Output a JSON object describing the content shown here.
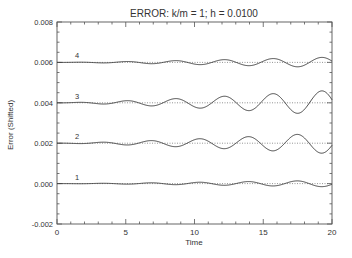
{
  "chart_data": {
    "type": "line",
    "title": "ERROR:  k/m = 1;  h = 0.0100",
    "xlabel": "Time",
    "ylabel": "Error (Shifted)",
    "xlim": [
      0,
      20
    ],
    "ylim": [
      -0.002,
      0.008
    ],
    "x_ticks": [
      0,
      5,
      10,
      15,
      20
    ],
    "x_tick_labels": [
      "0",
      "5",
      "10",
      "15",
      "20"
    ],
    "x_minor_step": 1,
    "y_ticks": [
      -0.002,
      0.0,
      0.002,
      0.004,
      0.006,
      0.008
    ],
    "y_tick_labels": [
      "-0.002",
      "0.000",
      "0.002",
      "0.004",
      "0.006",
      "0.008"
    ],
    "y_minor_step": 0.0005,
    "grid": false,
    "legend": "none (curves labeled inline 1-4)",
    "reference_lines": [
      {
        "y": 0.0,
        "style": "dotted"
      },
      {
        "y": 0.002,
        "style": "dotted"
      },
      {
        "y": 0.004,
        "style": "dotted"
      },
      {
        "y": 0.006,
        "style": "dotted"
      }
    ],
    "series": [
      {
        "name": "1",
        "baseline": 0.0,
        "amplitude_at_t20": 0.00016,
        "period": 3.55,
        "phase": 2.1,
        "x": [
          0,
          2,
          4,
          6,
          8,
          10,
          12,
          14,
          16,
          18,
          20
        ],
        "values": [
          0.0,
          1e-05,
          -2e-05,
          4e-05,
          5e-05,
          -6e-05,
          -4e-05,
          0.0001,
          2e-05,
          0.00012,
          -0.00012
        ]
      },
      {
        "name": "2",
        "baseline": 0.002,
        "amplitude_at_t20": 0.00052,
        "period": 3.55,
        "phase": 2.1,
        "x": [
          0,
          2,
          4,
          6,
          8,
          10,
          12,
          14,
          16,
          18,
          20
        ],
        "values": [
          0.002,
          0.00204,
          0.00193,
          0.00214,
          0.00219,
          0.00178,
          0.00186,
          0.00233,
          0.00207,
          0.0024,
          0.00248
        ]
      },
      {
        "name": "3",
        "baseline": 0.004,
        "amplitude_at_t20": 0.00062,
        "period": 3.55,
        "phase": 5.2,
        "x": [
          0,
          2,
          4,
          6,
          8,
          10,
          12,
          14,
          16,
          18,
          20
        ],
        "values": [
          0.004,
          0.00396,
          0.00406,
          0.00393,
          0.00421,
          0.00378,
          0.00431,
          0.00362,
          0.00412,
          0.00457,
          0.00342
        ]
      },
      {
        "name": "4",
        "baseline": 0.006,
        "amplitude_at_t20": 0.00026,
        "period": 3.55,
        "phase": 5.2,
        "x": [
          0,
          2,
          4,
          6,
          8,
          10,
          12,
          14,
          16,
          18,
          20
        ],
        "values": [
          0.006,
          0.00599,
          0.00602,
          0.00597,
          0.00608,
          0.00591,
          0.00612,
          0.00585,
          0.00605,
          0.00619,
          0.00589
        ]
      }
    ]
  },
  "labels": {
    "title": "ERROR:  k/m = 1;  h = 0.0100",
    "xlabel": "Time",
    "ylabel": "Error (Shifted)"
  }
}
